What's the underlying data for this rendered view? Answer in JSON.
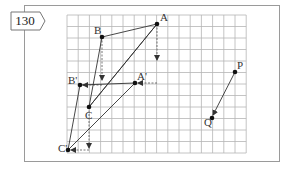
{
  "problem_number": "130",
  "grid": {
    "x0": 67,
    "y0": 15,
    "cols": 16,
    "rows": 12,
    "cell_w": 11.2,
    "cell_h": 11.5,
    "line_color": "#b5b5b5"
  },
  "triangle_original": {
    "A": {
      "label": "A",
      "x": 157,
      "y": 24
    },
    "B": {
      "label": "B",
      "x": 102,
      "y": 37
    },
    "C": {
      "label": "C",
      "x": 89,
      "y": 107
    }
  },
  "triangle_image": {
    "A_prime": {
      "label": "A'",
      "x": 135,
      "y": 83
    },
    "B_prime": {
      "label": "B'",
      "x": 80,
      "y": 85
    },
    "C_prime": {
      "label": "C'",
      "x": 68,
      "y": 150
    }
  },
  "vector_PQ": {
    "P": {
      "label": "P",
      "x": 235,
      "y": 72
    },
    "Q": {
      "label": "Q",
      "x": 212,
      "y": 118
    }
  },
  "colors": {
    "ink": "#222222",
    "frame": "#9a9a9a"
  }
}
